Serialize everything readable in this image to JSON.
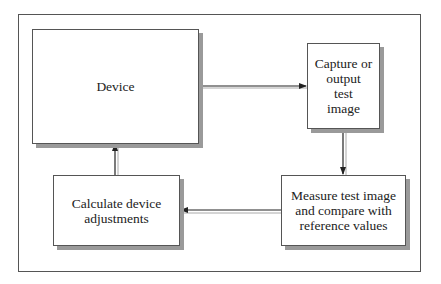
{
  "diagram": {
    "nodes": [
      {
        "id": "device",
        "label": "Device"
      },
      {
        "id": "capture",
        "label": "Capture or\noutput\ntest\nimage"
      },
      {
        "id": "measure",
        "label": "Measure test image\nand compare with\nreference values"
      },
      {
        "id": "calculate",
        "label": "Calculate device\nadjustments"
      }
    ],
    "edges": [
      {
        "from": "device",
        "to": "capture"
      },
      {
        "from": "capture",
        "to": "measure"
      },
      {
        "from": "measure",
        "to": "calculate"
      },
      {
        "from": "calculate",
        "to": "device"
      }
    ],
    "colors": {
      "line": "#222222",
      "shadow": "#9a9a9a",
      "border": "#555555"
    }
  }
}
